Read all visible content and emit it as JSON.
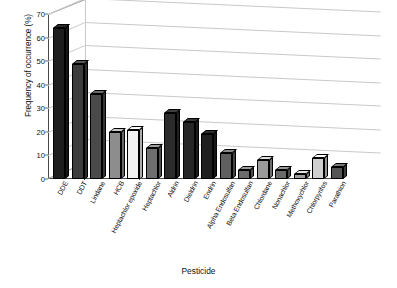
{
  "chart_data": {
    "type": "bar",
    "title": "",
    "xlabel": "Pesticide",
    "ylabel": "Frequency of occurrence (%)",
    "ylim": [
      0,
      70
    ],
    "ytick_step": 10,
    "yticks": [
      0,
      10,
      20,
      30,
      40,
      50,
      60,
      70
    ],
    "ytick_labels": [
      "0",
      "10",
      "20",
      "30",
      "40",
      "50",
      "60",
      "70"
    ],
    "grid": true,
    "legend": "none",
    "projection": "3d-perspective",
    "categories": [
      "DDE",
      "DDT",
      "Lindane",
      "HCB",
      "Heptachlor epoxide",
      "Heptachlor",
      "Aldrin",
      "Dieldrin",
      "Endrin",
      "Alpha Endosulfan",
      "Beta Endosulfan",
      "Chlordane",
      "Nonachlor",
      "Methoxychlor",
      "Chlorpyrifos",
      "Parathion"
    ],
    "values": [
      64,
      49,
      36,
      20,
      21,
      13,
      28,
      24,
      19,
      11,
      4,
      8,
      4,
      2,
      9,
      5
    ],
    "bar_shades": [
      "#1d1d1d",
      "#3c3c3c",
      "#4a4a4a",
      "#8d8d8d",
      "#f2f2f2",
      "#6e6e6e",
      "#2b2b2b",
      "#262626",
      "#1f1f1f",
      "#5f5f5f",
      "#6b6b6b",
      "#9a9a9a",
      "#6a6a6a",
      "#9e9e9e",
      "#cfcfcf",
      "#555555"
    ]
  },
  "axes": {
    "x_title": "Pesticide",
    "y_title": "Frequency of occurrence (%)"
  }
}
